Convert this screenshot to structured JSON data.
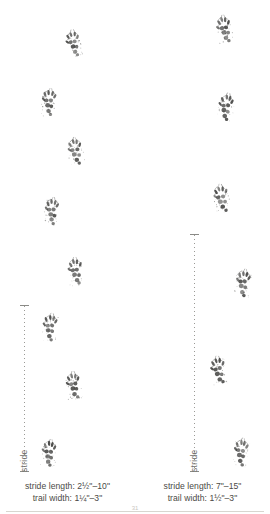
{
  "figure": {
    "width": 270,
    "height": 514,
    "background": "#ffffff",
    "ink_color": "#3a3a38",
    "rule_color": "#d8d6d0"
  },
  "columns": [
    {
      "id": "left-trail",
      "name": "left-track-pattern",
      "stride_label": "stride",
      "caption": {
        "stride_line": "stride length: 2½\"–10\"",
        "trail_line": "trail width: 1¼\"–3\""
      },
      "stride_bar": {
        "x": 20,
        "top": 305,
        "bottom": 472
      },
      "tracks": [
        {
          "x": 62,
          "y": 28,
          "rotate": -8,
          "scale": 0.92
        },
        {
          "x": 37,
          "y": 87,
          "rotate": 6,
          "scale": 0.95
        },
        {
          "x": 64,
          "y": 136,
          "rotate": -7,
          "scale": 0.95
        },
        {
          "x": 40,
          "y": 196,
          "rotate": 5,
          "scale": 0.95
        },
        {
          "x": 64,
          "y": 256,
          "rotate": -6,
          "scale": 0.95
        },
        {
          "x": 38,
          "y": 312,
          "rotate": 7,
          "scale": 0.95
        },
        {
          "x": 62,
          "y": 370,
          "rotate": -6,
          "scale": 0.95
        },
        {
          "x": 37,
          "y": 438,
          "rotate": 6,
          "scale": 0.95
        }
      ]
    },
    {
      "id": "right-trail",
      "name": "right-track-pattern",
      "stride_label": "stride",
      "caption": {
        "stride_line": "stride length: 7\"–15\"",
        "trail_line": "trail width: 1½\"–3\""
      },
      "stride_bar": {
        "x": 190,
        "top": 234,
        "bottom": 472
      },
      "tracks": [
        {
          "x": 213,
          "y": 14,
          "rotate": -9,
          "scale": 0.97
        },
        {
          "x": 214,
          "y": 92,
          "rotate": 9,
          "scale": 0.97
        },
        {
          "x": 210,
          "y": 183,
          "rotate": -9,
          "scale": 0.97
        },
        {
          "x": 231,
          "y": 268,
          "rotate": 8,
          "scale": 0.97
        },
        {
          "x": 207,
          "y": 355,
          "rotate": -8,
          "scale": 0.97
        },
        {
          "x": 229,
          "y": 437,
          "rotate": 8,
          "scale": 0.97
        }
      ]
    }
  ],
  "page_number": "31"
}
